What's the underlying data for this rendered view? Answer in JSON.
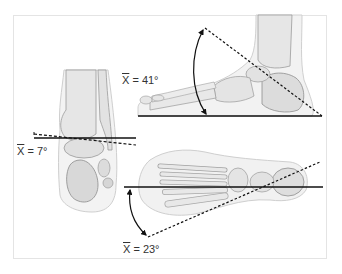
{
  "figure": {
    "panels": [
      {
        "id": "lateral-view",
        "description": "Lateral view of foot skeleton with dorsiflexion angle",
        "label_symbol": "X",
        "label_value": "= 41°"
      },
      {
        "id": "posterior-view",
        "description": "Posterior view of ankle/heel with subtalar angle",
        "label_symbol": "X",
        "label_value": "= 7°"
      },
      {
        "id": "dorsal-view",
        "description": "Dorsal (top) view of foot skeleton with abduction angle",
        "label_symbol": "X",
        "label_value": "= 23°"
      }
    ],
    "colors": {
      "line": "#111111",
      "bone_fill": "#e8e8e8",
      "bone_stroke": "#8a8a8a",
      "soft_tissue": "#f1f1f1",
      "frame_border": "#e4e4e4"
    }
  }
}
